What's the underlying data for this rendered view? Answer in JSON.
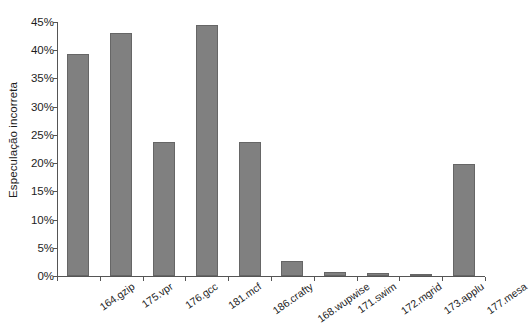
{
  "chart_data": {
    "type": "bar",
    "title": "",
    "xlabel": "",
    "ylabel": "Especulação incorreta",
    "ylim": [
      0,
      45
    ],
    "ytick_labels": [
      "0%",
      "5%",
      "10%",
      "15%",
      "20%",
      "25%",
      "30%",
      "35%",
      "40%",
      "45%"
    ],
    "ytick_values": [
      0,
      5,
      10,
      15,
      20,
      25,
      30,
      35,
      40,
      45
    ],
    "grid": false,
    "legend": null,
    "categories": [
      "164.gzip",
      "175.vpr",
      "176.gcc",
      "181.mcf",
      "186.crafty",
      "168.wupwise",
      "171.swim",
      "172.mgrid",
      "173.applu",
      "177.mesa"
    ],
    "values": [
      39.3,
      43.0,
      23.8,
      44.4,
      23.8,
      2.7,
      0.7,
      0.6,
      0.4,
      19.8
    ],
    "bar_color": "#808080",
    "bar_edge_color": "#666666",
    "axis_color": "#555555",
    "background_color": "#ffffff"
  }
}
